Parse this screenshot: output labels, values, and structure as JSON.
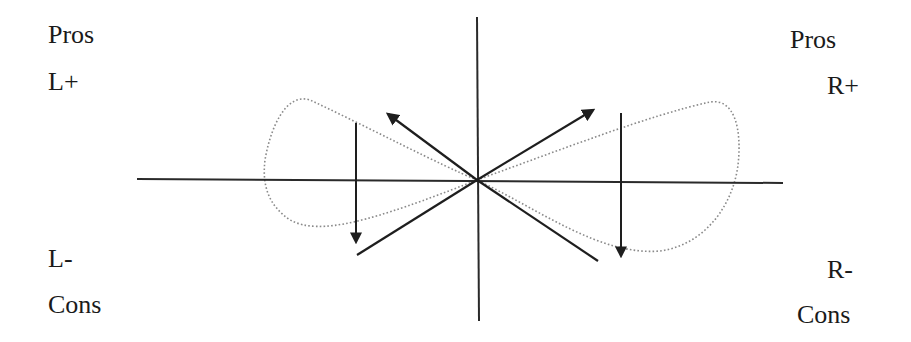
{
  "labels": {
    "top_left": {
      "line1": "Pros",
      "line2": "L+"
    },
    "top_right": {
      "line1": "Pros",
      "line2": "R+"
    },
    "bottom_left": {
      "line1": "L-",
      "line2": "Cons"
    },
    "bottom_right": {
      "line1": "R-",
      "line2": "Cons"
    }
  },
  "colors": {
    "axis": "#2a2a2a",
    "arrow": "#1e1e1e",
    "dotted_loop": "#8a8a8a",
    "text": "#1a1a1a"
  },
  "elements": {
    "horizontal_axis": "horizontal axis",
    "vertical_axis": "vertical axis",
    "upper_left_arrow": "diagonal arrow toward L+",
    "upper_right_arrow": "diagonal arrow toward R+",
    "lower_left_line": "diagonal line toward L-",
    "lower_right_line": "diagonal line toward R-",
    "left_down_arrow": "vertical arrow down on left",
    "right_down_arrow": "vertical arrow down on right",
    "dotted_loop": "dotted figure-eight loop"
  }
}
